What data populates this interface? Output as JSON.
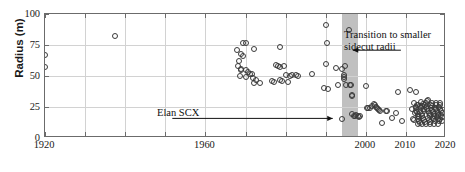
{
  "chart_data": {
    "type": "scatter",
    "title": "",
    "xlabel": "",
    "ylabel": "Radius (m)",
    "xlim": [
      1920,
      2020
    ],
    "ylim": [
      0,
      100
    ],
    "grid": true,
    "legend": null,
    "xticks": [
      1920,
      1930,
      1940,
      1950,
      1960,
      1970,
      1980,
      1990,
      2000,
      2010,
      2020
    ],
    "xticklabels": [
      "1920",
      "",
      "",
      "",
      "1960",
      "",
      "",
      "",
      "2000",
      "2010",
      "2020"
    ],
    "yticks": [
      0,
      25,
      50,
      75,
      100
    ],
    "yticklabels": [
      "0",
      "25",
      "50",
      "75",
      "100"
    ],
    "marker": "open-circle",
    "marker_color": "#3a3a3a",
    "shaded_region": {
      "label": "transition band",
      "x_start": 1994,
      "x_end": 1998,
      "color": "#bdbdbd"
    },
    "annotations": [
      {
        "name": "transition-annotation",
        "text_line1": "Transition to smaller",
        "text_line2": "sidecut radii",
        "arrow_from_x": 2009,
        "arrow_from_y": 70,
        "arrow_to_x": 1997,
        "arrow_to_y": 70
      },
      {
        "name": "elan-scx-annotation",
        "text_line1": "Elan SCX",
        "text_line2": "",
        "arrow_from_x": 1952,
        "arrow_from_y": 15,
        "arrow_to_x": 1992,
        "arrow_to_y": 15
      }
    ],
    "points": [
      [
        1920.0,
        67.0
      ],
      [
        1920.0,
        57.0
      ],
      [
        1937.5,
        82.0
      ],
      [
        1968.0,
        71.0
      ],
      [
        1969.5,
        77.0
      ],
      [
        1970.0,
        76.5
      ],
      [
        1969.0,
        68.0
      ],
      [
        1969.3,
        66.5
      ],
      [
        1972.0,
        71.5
      ],
      [
        1968.5,
        62.0
      ],
      [
        1968.2,
        58.0
      ],
      [
        1968.8,
        56.0
      ],
      [
        1969.0,
        54.5
      ],
      [
        1970.0,
        55.0
      ],
      [
        1970.5,
        53.0
      ],
      [
        1971.0,
        51.5
      ],
      [
        1971.5,
        52.0
      ],
      [
        1970.2,
        49.0
      ],
      [
        1968.6,
        50.0
      ],
      [
        1971.8,
        48.5
      ],
      [
        1972.5,
        46.5
      ],
      [
        1973.5,
        44.0
      ],
      [
        1972.0,
        44.5
      ],
      [
        1978.5,
        73.5
      ],
      [
        1977.5,
        59.0
      ],
      [
        1978.0,
        58.0
      ],
      [
        1978.5,
        57.5
      ],
      [
        1979.5,
        58.0
      ],
      [
        1976.5,
        46.0
      ],
      [
        1977.0,
        45.5
      ],
      [
        1978.5,
        47.0
      ],
      [
        1980.0,
        50.5
      ],
      [
        1981.0,
        50.0
      ],
      [
        1981.5,
        51.0
      ],
      [
        1982.5,
        50.5
      ],
      [
        1983.0,
        50.0
      ],
      [
        1979.0,
        46.0
      ],
      [
        1980.5,
        45.0
      ],
      [
        1986.5,
        51.5
      ],
      [
        1990.0,
        91.0
      ],
      [
        1990.2,
        77.0
      ],
      [
        1990.0,
        60.0
      ],
      [
        1992.5,
        56.5
      ],
      [
        1994.0,
        56.0
      ],
      [
        1989.5,
        40.0
      ],
      [
        1990.5,
        39.5
      ],
      [
        1993.0,
        43.0
      ],
      [
        1994.8,
        58.0
      ],
      [
        1994.5,
        51.0
      ],
      [
        1994.6,
        49.5
      ],
      [
        1994.5,
        47.5
      ],
      [
        1995.0,
        43.0
      ],
      [
        1996.0,
        43.0
      ],
      [
        1996.2,
        42.5
      ],
      [
        1995.8,
        87.0
      ],
      [
        1996.5,
        35.0
      ],
      [
        1996.6,
        34.0
      ],
      [
        1994.0,
        15.0
      ],
      [
        1996.5,
        19.0
      ],
      [
        1997.0,
        18.0
      ],
      [
        1997.2,
        17.5
      ],
      [
        1997.5,
        18.5
      ],
      [
        1998.0,
        18.0
      ],
      [
        1998.3,
        17.0
      ],
      [
        1998.5,
        17.5
      ],
      [
        2000.0,
        42.0
      ],
      [
        2000.2,
        24.5
      ],
      [
        2000.5,
        24.0
      ],
      [
        2001.0,
        24.5
      ],
      [
        2001.5,
        25.5
      ],
      [
        2002.0,
        27.5
      ],
      [
        2002.2,
        26.5
      ],
      [
        2002.5,
        25.0
      ],
      [
        2002.8,
        24.0
      ],
      [
        2003.0,
        23.5
      ],
      [
        2003.2,
        22.5
      ],
      [
        2003.5,
        22.0
      ],
      [
        2004.0,
        12.0
      ],
      [
        2005.0,
        21.5
      ],
      [
        2005.3,
        21.5
      ],
      [
        2006.5,
        16.0
      ],
      [
        2007.5,
        20.0
      ],
      [
        2008.0,
        37.0
      ],
      [
        2009.0,
        14.0
      ],
      [
        2011.0,
        38.5
      ],
      [
        2011.5,
        23.0
      ],
      [
        2012.5,
        37.0
      ],
      [
        2011.8,
        15.0
      ],
      [
        2012.0,
        14.5
      ],
      [
        2012.2,
        20.0
      ],
      [
        2012.5,
        25.0
      ],
      [
        2012.6,
        24.0
      ],
      [
        2012.8,
        26.5
      ],
      [
        2013.0,
        27.0
      ],
      [
        2012.4,
        22.0
      ],
      [
        2012.7,
        21.0
      ],
      [
        2012.9,
        19.5
      ],
      [
        2013.1,
        18.0
      ],
      [
        2013.3,
        17.0
      ],
      [
        2013.0,
        15.5
      ],
      [
        2013.2,
        14.0
      ],
      [
        2013.4,
        12.5
      ],
      [
        2013.6,
        25.5
      ],
      [
        2013.8,
        24.5
      ],
      [
        2014.0,
        26.0
      ],
      [
        2014.2,
        27.5
      ],
      [
        2013.5,
        21.0
      ],
      [
        2013.9,
        19.0
      ],
      [
        2014.1,
        17.5
      ],
      [
        2014.3,
        16.0
      ],
      [
        2014.5,
        14.5
      ],
      [
        2014.7,
        13.0
      ],
      [
        2014.4,
        23.0
      ],
      [
        2014.6,
        22.0
      ],
      [
        2014.8,
        26.5
      ],
      [
        2015.0,
        28.0
      ],
      [
        2015.2,
        29.5
      ],
      [
        2015.4,
        31.0
      ],
      [
        2015.1,
        25.0
      ],
      [
        2015.3,
        23.5
      ],
      [
        2015.5,
        22.0
      ],
      [
        2015.7,
        20.5
      ],
      [
        2015.9,
        19.0
      ],
      [
        2016.1,
        17.5
      ],
      [
        2015.6,
        16.0
      ],
      [
        2015.8,
        14.5
      ],
      [
        2016.0,
        13.0
      ],
      [
        2016.2,
        27.0
      ],
      [
        2016.4,
        28.5
      ],
      [
        2016.6,
        26.0
      ],
      [
        2016.3,
        24.0
      ],
      [
        2016.5,
        22.5
      ],
      [
        2016.7,
        21.0
      ],
      [
        2016.9,
        19.5
      ],
      [
        2017.1,
        18.0
      ],
      [
        2016.8,
        16.5
      ],
      [
        2017.0,
        15.0
      ],
      [
        2017.2,
        13.5
      ],
      [
        2017.4,
        28.0
      ],
      [
        2017.6,
        26.5
      ],
      [
        2017.3,
        24.5
      ],
      [
        2017.5,
        23.0
      ],
      [
        2017.7,
        21.5
      ],
      [
        2017.9,
        20.0
      ],
      [
        2018.1,
        18.5
      ],
      [
        2017.8,
        17.0
      ],
      [
        2018.0,
        15.5
      ],
      [
        2018.2,
        14.0
      ],
      [
        2018.4,
        28.5
      ],
      [
        2018.6,
        27.0
      ],
      [
        2018.3,
        25.0
      ],
      [
        2018.5,
        23.5
      ],
      [
        2018.7,
        22.0
      ],
      [
        2018.9,
        20.5
      ],
      [
        2018.8,
        18.5
      ],
      [
        2019.0,
        17.0
      ],
      [
        2018.6,
        15.0
      ],
      [
        2019.1,
        13.5
      ],
      [
        2012.1,
        28.0
      ],
      [
        2013.7,
        29.0
      ],
      [
        2015.05,
        11.5
      ],
      [
        2016.05,
        11.0
      ],
      [
        2017.05,
        11.5
      ],
      [
        2018.05,
        11.0
      ],
      [
        2014.05,
        11.5
      ],
      [
        2013.05,
        11.0
      ]
    ]
  }
}
